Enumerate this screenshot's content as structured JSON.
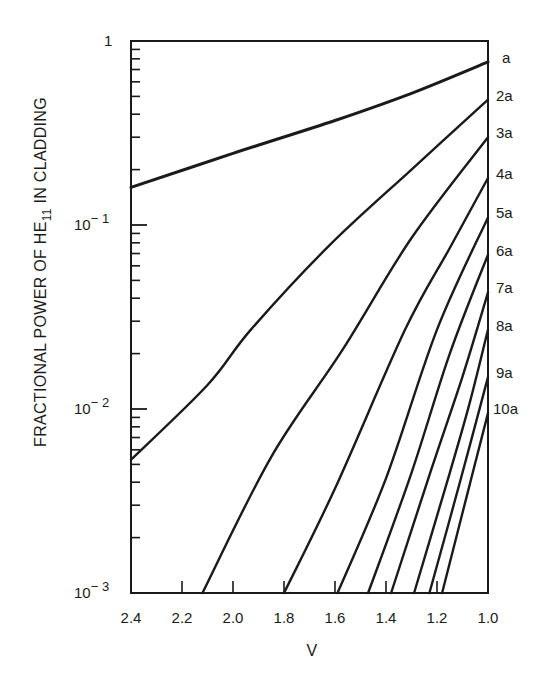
{
  "chart_data": {
    "type": "line",
    "title": "",
    "xlabel": "V",
    "ylabel": "FRACTIONAL POWER OF HE11 IN CLADDING",
    "ylabel_parts": {
      "pre": "FRACTIONAL POWER OF HE",
      "sub": "11",
      "post": " IN CLADDING"
    },
    "x_scale": "linear",
    "y_scale": "log",
    "xlim": [
      2.4,
      1.0
    ],
    "ylim": [
      0.001,
      1
    ],
    "x_ticks": [
      {
        "value": 2.4,
        "label": "2.4"
      },
      {
        "value": 2.2,
        "label": "2.2"
      },
      {
        "value": 2.0,
        "label": "2.0"
      },
      {
        "value": 1.8,
        "label": "1.8"
      },
      {
        "value": 1.6,
        "label": "1.6"
      },
      {
        "value": 1.4,
        "label": "1.4"
      },
      {
        "value": 1.2,
        "label": "1.2"
      },
      {
        "value": 1.0,
        "label": "1.0"
      }
    ],
    "y_ticks": [
      {
        "value": 1,
        "base": "1",
        "exp": ""
      },
      {
        "value": 0.1,
        "base": "10",
        "exp": "− 1"
      },
      {
        "value": 0.01,
        "base": "10",
        "exp": "− 2"
      },
      {
        "value": 0.001,
        "base": "10",
        "exp": "− 3"
      }
    ],
    "grid": false,
    "legend_position": "curve labels at right edge",
    "series": [
      {
        "name": "a",
        "points": [
          [
            2.4,
            0.16
          ],
          [
            2.0,
            0.245
          ],
          [
            1.6,
            0.37
          ],
          [
            1.3,
            0.52
          ],
          [
            1.0,
            0.77
          ]
        ]
      },
      {
        "name": "2a",
        "points": [
          [
            2.4,
            0.0053
          ],
          [
            2.1,
            0.0135
          ],
          [
            1.93,
            0.027
          ],
          [
            1.62,
            0.078
          ],
          [
            1.3,
            0.2
          ],
          [
            1.0,
            0.48
          ]
        ]
      },
      {
        "name": "3a",
        "points": [
          [
            2.12,
            0.001
          ],
          [
            1.85,
            0.0055
          ],
          [
            1.57,
            0.021
          ],
          [
            1.3,
            0.085
          ],
          [
            1.0,
            0.3
          ]
        ]
      },
      {
        "name": "4a",
        "points": [
          [
            1.8,
            0.001
          ],
          [
            1.6,
            0.0037
          ],
          [
            1.325,
            0.027
          ],
          [
            1.15,
            0.075
          ],
          [
            1.0,
            0.18
          ]
        ]
      },
      {
        "name": "5a",
        "points": [
          [
            1.59,
            0.001
          ],
          [
            1.4,
            0.0042
          ],
          [
            1.2,
            0.027
          ],
          [
            1.0,
            0.11
          ]
        ]
      },
      {
        "name": "6a",
        "points": [
          [
            1.47,
            0.001
          ],
          [
            1.3,
            0.0045
          ],
          [
            1.15,
            0.02
          ],
          [
            1.0,
            0.069
          ]
        ]
      },
      {
        "name": "7a",
        "points": [
          [
            1.38,
            0.001
          ],
          [
            1.22,
            0.0048
          ],
          [
            1.1,
            0.015
          ],
          [
            1.0,
            0.043
          ]
        ]
      },
      {
        "name": "8a",
        "points": [
          [
            1.29,
            0.001
          ],
          [
            1.15,
            0.0045
          ],
          [
            1.07,
            0.011
          ],
          [
            1.0,
            0.027
          ]
        ]
      },
      {
        "name": "9a",
        "points": [
          [
            1.23,
            0.001
          ],
          [
            1.11,
            0.004
          ],
          [
            1.0,
            0.0149
          ]
        ]
      },
      {
        "name": "10a",
        "points": [
          [
            1.18,
            0.001
          ],
          [
            1.08,
            0.0035
          ],
          [
            1.0,
            0.0095
          ]
        ]
      }
    ]
  },
  "colors": {
    "line": "#1a1a1a",
    "background": "#ffffff"
  }
}
